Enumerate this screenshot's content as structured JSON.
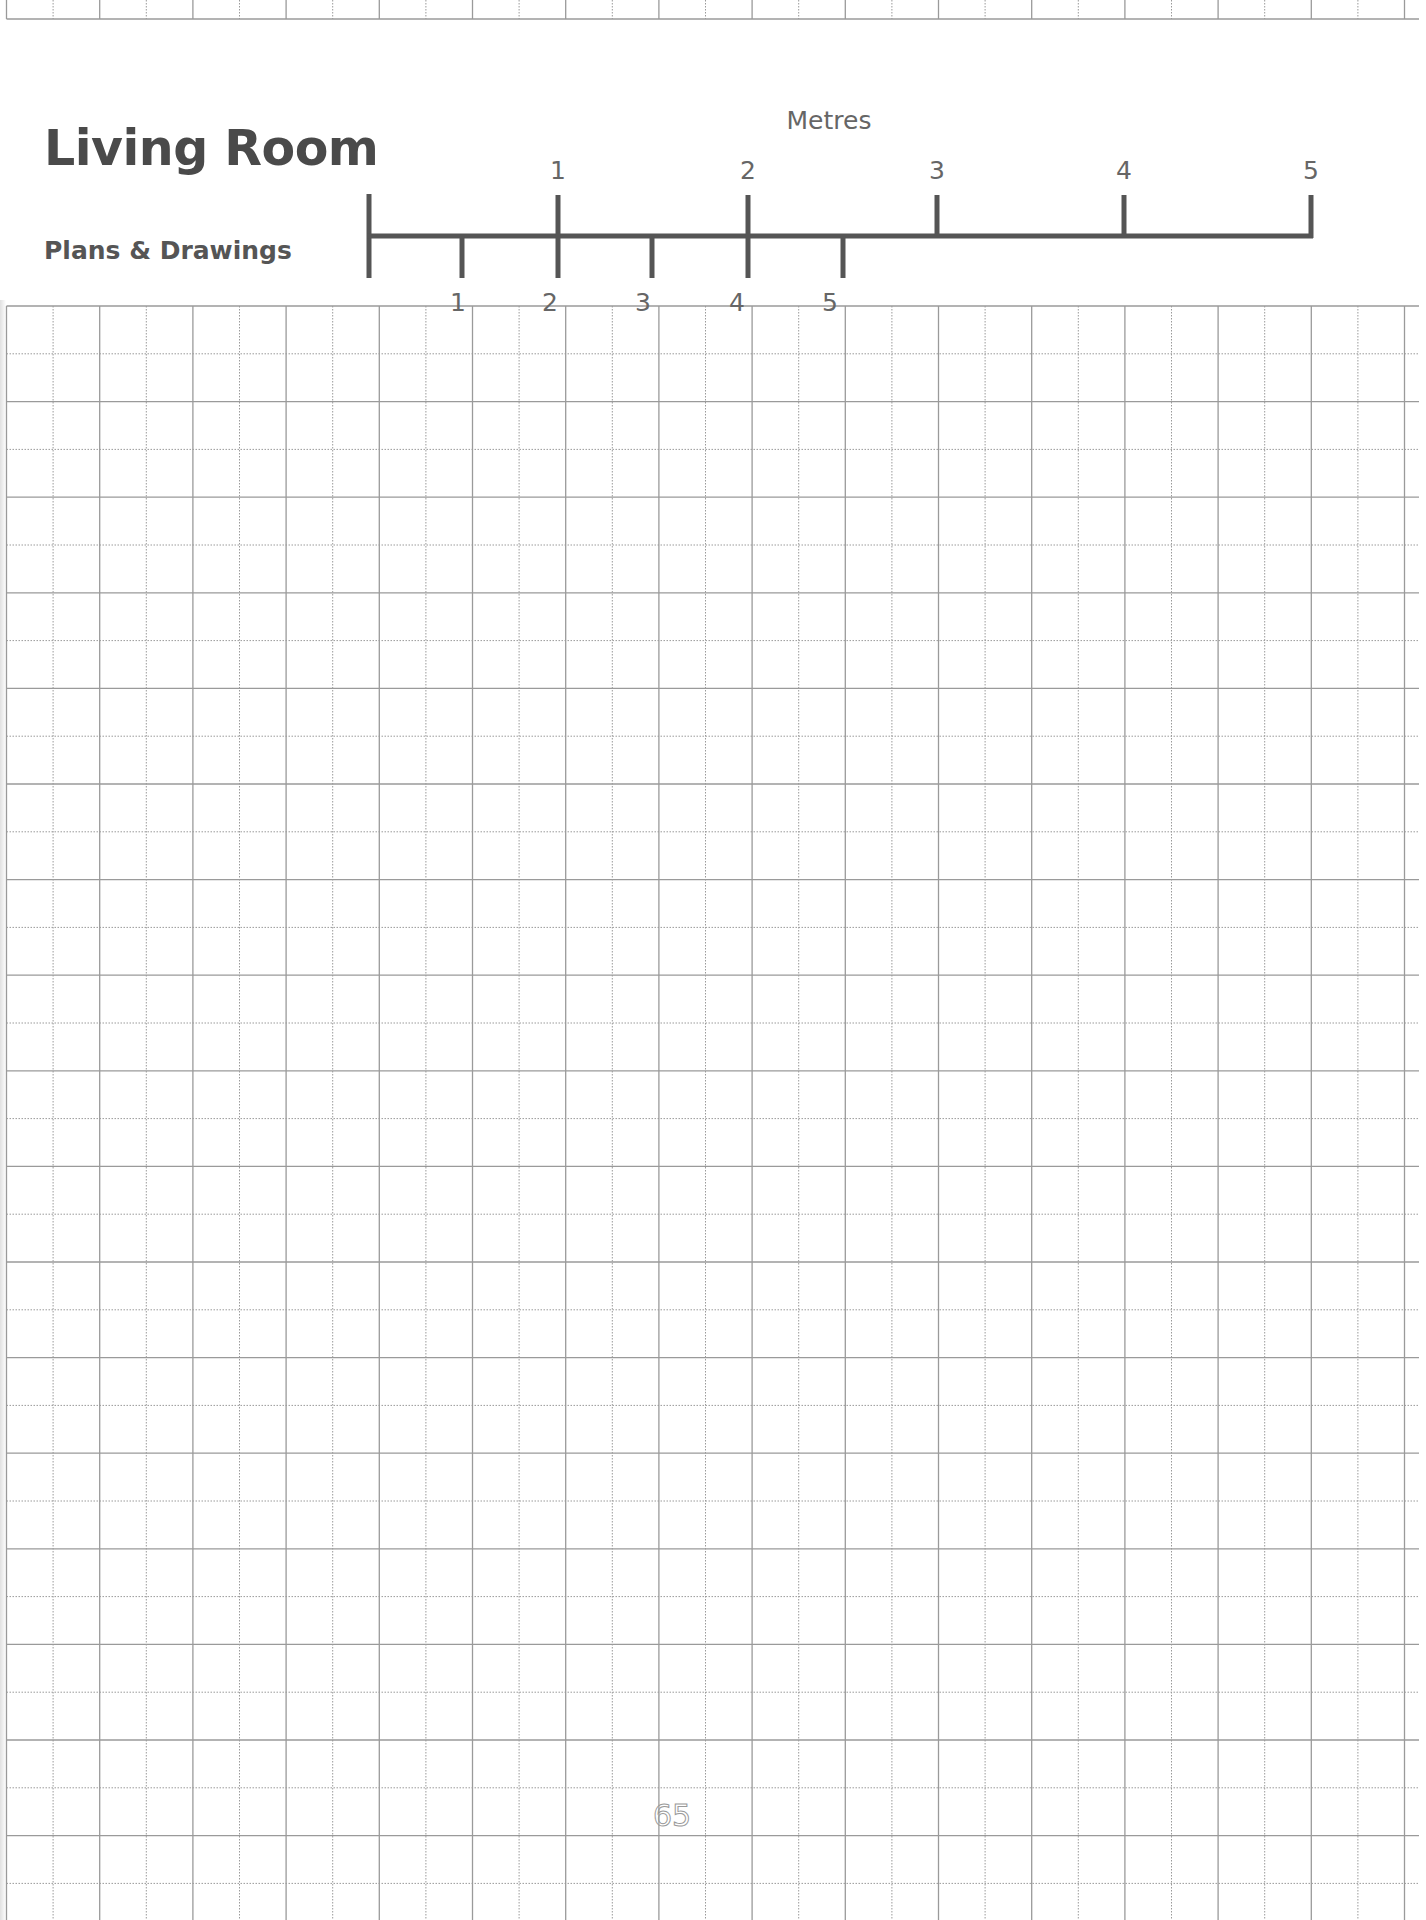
{
  "header": {
    "title": "Living Room",
    "subtitle": "Plans & Drawings"
  },
  "scale_bar": {
    "unit_label": "Metres",
    "upper_labels": [
      "1",
      "2",
      "3",
      "4",
      "5"
    ],
    "lower_labels": [
      "1",
      "2",
      "3",
      "4",
      "5"
    ],
    "color": "#555555"
  },
  "grid": {
    "line_color": "#9a9a9a",
    "pattern": "alternating solid and dotted lines",
    "cell_size_px": 47
  },
  "footer": {
    "page_number": "65"
  }
}
